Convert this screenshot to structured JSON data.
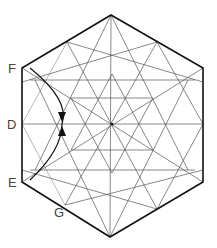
{
  "diagram": {
    "type": "geometric-construction",
    "shape": "hexagon",
    "labels": {
      "F": "F",
      "D": "D",
      "E": "E",
      "G": "G"
    },
    "colors": {
      "outline": "#111111",
      "construction": "#555555",
      "background": "#ffffff"
    }
  }
}
